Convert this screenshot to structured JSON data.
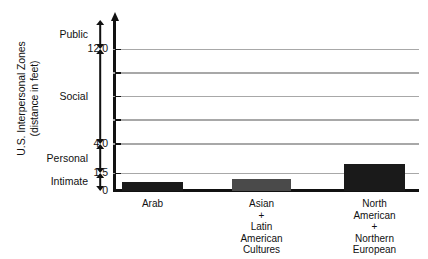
{
  "chart_data": {
    "type": "bar",
    "title": "",
    "xlabel": "",
    "ylabel": "U.S. Interpersonal Zones (distance in feet)",
    "ylabel_lines": [
      "U.S. Interpersonal Zones",
      "(distance in feet)"
    ],
    "categories": [
      "Arab",
      "Asian + Latin American Cultures",
      "North American + Northern European"
    ],
    "category_lines": [
      [
        "Arab"
      ],
      [
        "Asian",
        "+",
        "Latin",
        "American",
        "Cultures"
      ],
      [
        "North",
        "American",
        "+",
        "Northern",
        "European"
      ]
    ],
    "values": [
      0.8,
      1.0,
      2.3
    ],
    "ylim": [
      0,
      14.5
    ],
    "grid": true,
    "legend": "none",
    "tick_labels": [
      "12.0",
      "4.0",
      "1.5",
      "0"
    ],
    "tick_values": [
      12.0,
      4.0,
      1.5,
      0
    ],
    "gridline_values": [
      12.0,
      10.0,
      8.0,
      6.0,
      4.0,
      1.5
    ],
    "bar_colors": [
      "#1a1a1a",
      "#4a4a4a",
      "#1a1a1a"
    ],
    "zones": [
      {
        "name": "Public",
        "from": 12.0,
        "to": 14.5
      },
      {
        "name": "Social",
        "from": 4.0,
        "to": 12.0
      },
      {
        "name": "Personal",
        "from": 1.5,
        "to": 4.0
      },
      {
        "name": "Intimate",
        "from": 0.0,
        "to": 1.5
      }
    ],
    "axis_color": "#111111",
    "gridline_color": "#a8a8a8"
  }
}
